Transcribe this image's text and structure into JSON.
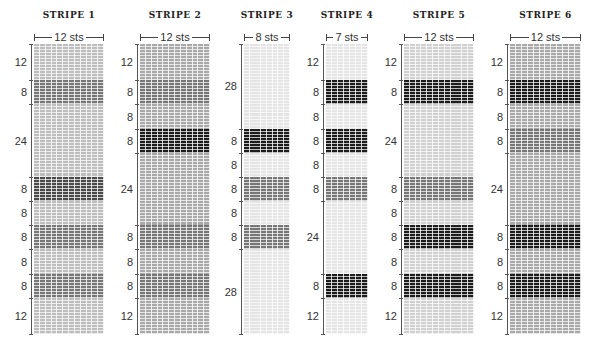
{
  "stripes": [
    {
      "title": "STRIPE 1",
      "sts_label": "12 sts",
      "stitches": 12,
      "grid_x": 34,
      "grid_w": 70,
      "base_shade": "shade-base-mid2",
      "bands": [
        {
          "rows": 12,
          "label": "12",
          "shade": "base"
        },
        {
          "rows": 8,
          "label": "8",
          "shade": "medium"
        },
        {
          "rows": 24,
          "label": "24",
          "shade": "base"
        },
        {
          "rows": 8,
          "label": "8",
          "shade": "dark"
        },
        {
          "rows": 8,
          "label": "8",
          "shade": "base"
        },
        {
          "rows": 8,
          "label": "8",
          "shade": "medium"
        },
        {
          "rows": 8,
          "label": "8",
          "shade": "base"
        },
        {
          "rows": 8,
          "label": "8",
          "shade": "medium"
        },
        {
          "rows": 12,
          "label": "12",
          "shade": "base"
        }
      ]
    },
    {
      "title": "STRIPE 2",
      "sts_label": "12 sts",
      "stitches": 12,
      "grid_x": 140,
      "grid_w": 70,
      "base_shade": "shade-base-mid",
      "bands": [
        {
          "rows": 12,
          "label": "12",
          "shade": "base"
        },
        {
          "rows": 8,
          "label": "8",
          "shade": "medium"
        },
        {
          "rows": 8,
          "label": "8",
          "shade": "base"
        },
        {
          "rows": 8,
          "label": "8",
          "shade": "black"
        },
        {
          "rows": 24,
          "label": "24",
          "shade": "base"
        },
        {
          "rows": 8,
          "label": "8",
          "shade": "medium"
        },
        {
          "rows": 8,
          "label": "8",
          "shade": "base"
        },
        {
          "rows": 8,
          "label": "8",
          "shade": "medium"
        },
        {
          "rows": 12,
          "label": "12",
          "shade": "base"
        }
      ]
    },
    {
      "title": "STRIPE 3",
      "sts_label": "8 sts",
      "stitches": 8,
      "grid_x": 244,
      "grid_w": 46,
      "base_shade": "shade-base-vlight",
      "bands": [
        {
          "rows": 28,
          "label": "28",
          "shade": "base"
        },
        {
          "rows": 8,
          "label": "8",
          "shade": "black"
        },
        {
          "rows": 8,
          "label": "8",
          "shade": "base"
        },
        {
          "rows": 8,
          "label": "8",
          "shade": "medium"
        },
        {
          "rows": 8,
          "label": "8",
          "shade": "base"
        },
        {
          "rows": 8,
          "label": "8",
          "shade": "medium"
        },
        {
          "rows": 28,
          "label": "28",
          "shade": "base"
        }
      ]
    },
    {
      "title": "STRIPE 4",
      "sts_label": "7 sts",
      "stitches": 7,
      "grid_x": 326,
      "grid_w": 42,
      "base_shade": "shade-base-vlight",
      "bands": [
        {
          "rows": 12,
          "label": "12",
          "shade": "base"
        },
        {
          "rows": 8,
          "label": "8",
          "shade": "black"
        },
        {
          "rows": 8,
          "label": "8",
          "shade": "base"
        },
        {
          "rows": 8,
          "label": "8",
          "shade": "black"
        },
        {
          "rows": 8,
          "label": "8",
          "shade": "base"
        },
        {
          "rows": 8,
          "label": "8",
          "shade": "medium"
        },
        {
          "rows": 24,
          "label": "24",
          "shade": "base"
        },
        {
          "rows": 8,
          "label": "8",
          "shade": "black"
        },
        {
          "rows": 12,
          "label": "12",
          "shade": "base"
        }
      ]
    },
    {
      "title": "STRIPE 5",
      "sts_label": "12 sts",
      "stitches": 12,
      "grid_x": 404,
      "grid_w": 70,
      "base_shade": "shade-base-light",
      "bands": [
        {
          "rows": 12,
          "label": "12",
          "shade": "base"
        },
        {
          "rows": 8,
          "label": "8",
          "shade": "black"
        },
        {
          "rows": 24,
          "label": "24",
          "shade": "base"
        },
        {
          "rows": 8,
          "label": "8",
          "shade": "medium"
        },
        {
          "rows": 8,
          "label": "8",
          "shade": "base"
        },
        {
          "rows": 8,
          "label": "8",
          "shade": "black"
        },
        {
          "rows": 8,
          "label": "8",
          "shade": "base"
        },
        {
          "rows": 8,
          "label": "8",
          "shade": "black"
        },
        {
          "rows": 12,
          "label": "12",
          "shade": "base"
        }
      ]
    },
    {
      "title": "STRIPE 6",
      "sts_label": "12 sts",
      "stitches": 12,
      "grid_x": 510,
      "grid_w": 71,
      "base_shade": "shade-base-mid",
      "bands": [
        {
          "rows": 12,
          "label": "12",
          "shade": "base"
        },
        {
          "rows": 8,
          "label": "8",
          "shade": "black"
        },
        {
          "rows": 8,
          "label": "8",
          "shade": "base"
        },
        {
          "rows": 8,
          "label": "8",
          "shade": "medium"
        },
        {
          "rows": 24,
          "label": "24",
          "shade": "base"
        },
        {
          "rows": 8,
          "label": "8",
          "shade": "black"
        },
        {
          "rows": 8,
          "label": "8",
          "shade": "base"
        },
        {
          "rows": 8,
          "label": "8",
          "shade": "black"
        },
        {
          "rows": 12,
          "label": "12",
          "shade": "base"
        }
      ]
    }
  ],
  "colors": {
    "black": "#1c1c1c",
    "dark": "#4a4a4a",
    "medium": "#777777",
    "base_mid": "#a9a9a9",
    "base_light": "#d0d0d0",
    "base_vlight": "#e4e4e4"
  }
}
